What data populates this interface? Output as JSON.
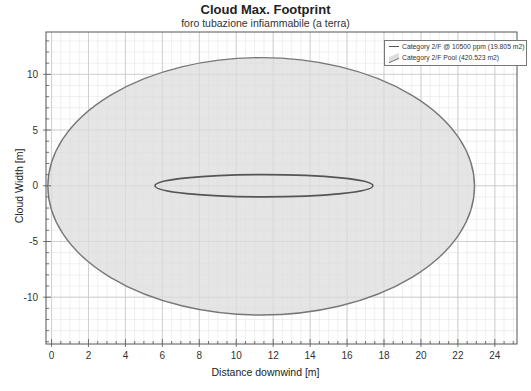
{
  "chart_data": {
    "type": "area",
    "title": "Cloud Max. Footprint",
    "subtitle": "foro tubazione infiammabile (a terra)",
    "xlabel": "Distance downwind [m]",
    "ylabel": "Cloud Width [m]",
    "xlim": [
      -0.3,
      25.2
    ],
    "ylim": [
      -14.2,
      13.8
    ],
    "x_ticks": [
      0,
      2,
      4,
      6,
      8,
      10,
      12,
      14,
      16,
      18,
      20,
      22,
      24
    ],
    "y_ticks": [
      -10,
      -5,
      0,
      5,
      10
    ],
    "grid": true,
    "legend_position": "upper right",
    "series": [
      {
        "name": "Category 2/F @ 10500 ppm (19.805 m2)",
        "kind": "line",
        "shape": "ellipse",
        "x_min": 5.6,
        "x_max": 17.4,
        "y_min": -1.0,
        "y_max": 1.0,
        "color": "#555555"
      },
      {
        "name": "Category 2/F Pool (420.523 m2)",
        "kind": "filled",
        "shape": "ellipse",
        "x_min": -0.2,
        "x_max": 22.9,
        "y_min": -11.6,
        "y_max": 11.5,
        "fill": "#dcdcdc",
        "color": "#777777"
      }
    ]
  },
  "legend": {
    "items": [
      {
        "label": "Category 2/F @ 10500 ppm (19.805 m2)"
      },
      {
        "label": "Category 2/F Pool (420.523 m2)"
      }
    ]
  },
  "tick_labels": {
    "x": [
      "0",
      "2",
      "4",
      "6",
      "8",
      "10",
      "12",
      "14",
      "16",
      "18",
      "20",
      "22",
      "24"
    ],
    "y": [
      "10",
      "5",
      "0",
      "-5",
      "-10"
    ]
  }
}
